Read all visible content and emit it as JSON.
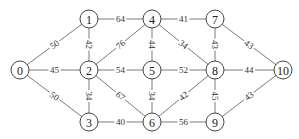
{
  "graph": {
    "node_radius": 9,
    "nodes": [
      {
        "id": "0",
        "label": "0",
        "x": 20,
        "y": 70
      },
      {
        "id": "1",
        "label": "1",
        "x": 89,
        "y": 19
      },
      {
        "id": "2",
        "label": "2",
        "x": 89,
        "y": 70
      },
      {
        "id": "3",
        "label": "3",
        "x": 89,
        "y": 122
      },
      {
        "id": "4",
        "label": "4",
        "x": 152,
        "y": 19
      },
      {
        "id": "5",
        "label": "5",
        "x": 152,
        "y": 70
      },
      {
        "id": "6",
        "label": "6",
        "x": 152,
        "y": 122
      },
      {
        "id": "7",
        "label": "7",
        "x": 215,
        "y": 19
      },
      {
        "id": "8",
        "label": "8",
        "x": 215,
        "y": 70
      },
      {
        "id": "9",
        "label": "9",
        "x": 215,
        "y": 122
      },
      {
        "id": "10",
        "label": "10",
        "x": 283,
        "y": 70
      }
    ],
    "edges": [
      {
        "from": "0",
        "to": "1",
        "weight": "50",
        "rotated": true
      },
      {
        "from": "0",
        "to": "2",
        "weight": "45",
        "rotated": false
      },
      {
        "from": "0",
        "to": "3",
        "weight": "50",
        "rotated": true
      },
      {
        "from": "1",
        "to": "2",
        "weight": "42",
        "rotated": true
      },
      {
        "from": "1",
        "to": "4",
        "weight": "64",
        "rotated": false
      },
      {
        "from": "2",
        "to": "4",
        "weight": "76",
        "rotated": true
      },
      {
        "from": "2",
        "to": "5",
        "weight": "54",
        "rotated": false
      },
      {
        "from": "2",
        "to": "3",
        "weight": "34",
        "rotated": true
      },
      {
        "from": "2",
        "to": "6",
        "weight": "67",
        "rotated": true
      },
      {
        "from": "3",
        "to": "6",
        "weight": "40",
        "rotated": false
      },
      {
        "from": "4",
        "to": "5",
        "weight": "44",
        "rotated": true
      },
      {
        "from": "4",
        "to": "7",
        "weight": "41",
        "rotated": false
      },
      {
        "from": "4",
        "to": "8",
        "weight": "34",
        "rotated": true
      },
      {
        "from": "5",
        "to": "8",
        "weight": "52",
        "rotated": false
      },
      {
        "from": "5",
        "to": "6",
        "weight": "34",
        "rotated": true
      },
      {
        "from": "6",
        "to": "8",
        "weight": "42",
        "rotated": true
      },
      {
        "from": "6",
        "to": "9",
        "weight": "56",
        "rotated": false
      },
      {
        "from": "7",
        "to": "8",
        "weight": "43",
        "rotated": true
      },
      {
        "from": "7",
        "to": "10",
        "weight": "43",
        "rotated": true
      },
      {
        "from": "8",
        "to": "10",
        "weight": "44",
        "rotated": false
      },
      {
        "from": "8",
        "to": "9",
        "weight": "45",
        "rotated": true
      },
      {
        "from": "9",
        "to": "10",
        "weight": "43",
        "rotated": true
      }
    ]
  }
}
